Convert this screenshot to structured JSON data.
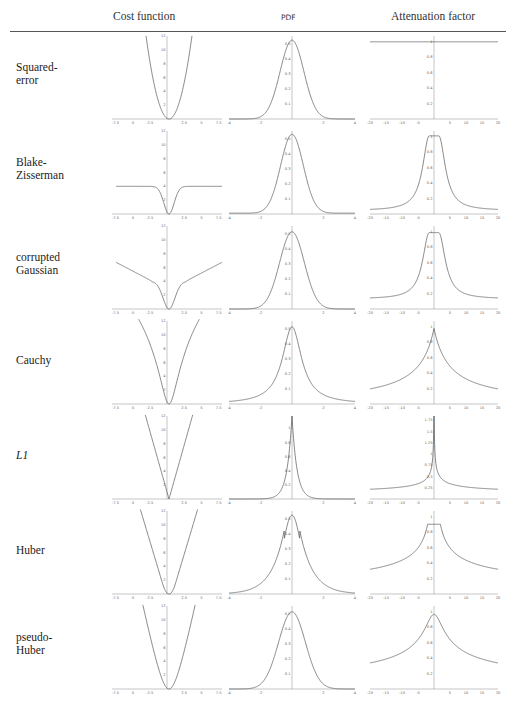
{
  "headers": {
    "cost": "Cost function",
    "pdf": "PDF",
    "attenuation": "Attenuation factor"
  },
  "rows": [
    {
      "label_line1": "Squared-",
      "label_line2": "error"
    },
    {
      "label_line1": "Blake-",
      "label_line2": "Zisserman"
    },
    {
      "label_line1": "corrupted",
      "label_line2": "Gaussian"
    },
    {
      "label_line1": "Cauchy",
      "label_line2": ""
    },
    {
      "label_line1": "L1",
      "label_line2": ""
    },
    {
      "label_line1": "Huber",
      "label_line2": ""
    },
    {
      "label_line1": "pseudo-",
      "label_line2": "Huber"
    }
  ],
  "axes": {
    "cost_x_ticks": [
      "-7.5",
      "-5",
      "-2.5",
      "2.5",
      "5",
      "7.5"
    ],
    "cost_y_ticks": [
      "2",
      "4",
      "6",
      "8",
      "10",
      "12"
    ],
    "pdf_x_ticks": [
      "-4",
      "-2",
      "2",
      "4"
    ],
    "pdf_y_ticks": [
      "0.1",
      "0.2",
      "0.3",
      "0.4",
      "0.5"
    ],
    "att_x_ticks": [
      "-20",
      "-15",
      "-10",
      "-5",
      "5",
      "10",
      "15",
      "20"
    ],
    "att_y_ticks": [
      "0.2",
      "0.4",
      "0.6",
      "0.8",
      "1"
    ],
    "l1_att_y_ticks": [
      "0.25",
      "0.5",
      "0.75",
      "1",
      "1.25",
      "1.5",
      "1.75"
    ],
    "l1_pdf_y_ticks": [
      "0.2",
      "0.4",
      "0.6",
      "0.8",
      "1"
    ]
  },
  "chart_data": [
    {
      "type": "line",
      "title": "Squared-error cost",
      "x": [
        -7.5,
        -5,
        -2.5,
        0,
        2.5,
        5,
        7.5
      ],
      "values": [
        56,
        25,
        6.25,
        0,
        6.25,
        25,
        56
      ],
      "xlabel": "",
      "ylabel": "",
      "ylim": [
        0,
        12
      ]
    },
    {
      "type": "line",
      "title": "Squared-error PDF",
      "x": [
        -4,
        -2,
        -1,
        0,
        1,
        2,
        4
      ],
      "values": [
        0,
        0.05,
        0.24,
        0.4,
        0.24,
        0.05,
        0
      ],
      "ylim": [
        0,
        0.5
      ]
    },
    {
      "type": "line",
      "title": "Squared-error attenuation",
      "x": [
        -20,
        0,
        20
      ],
      "values": [
        1,
        1,
        1
      ],
      "ylim": [
        0,
        1
      ]
    },
    {
      "type": "line",
      "title": "Blake-Zisserman cost",
      "x": [
        -7.5,
        -2.5,
        -1,
        0,
        1,
        2.5,
        7.5
      ],
      "values": [
        4,
        4,
        1.5,
        0,
        1.5,
        4,
        4
      ],
      "ylim": [
        0,
        12
      ]
    },
    {
      "type": "line",
      "title": "Blake-Zisserman attenuation",
      "x": [
        -20,
        -10,
        -5,
        0,
        5,
        10,
        20
      ],
      "values": [
        0.1,
        0.2,
        0.4,
        1,
        0.4,
        0.2,
        0.1
      ],
      "ylim": [
        0,
        1
      ]
    },
    {
      "type": "line",
      "title": "corrupted Gaussian cost",
      "x": [
        -7.5,
        -2.5,
        0,
        2.5,
        7.5
      ],
      "values": [
        6.5,
        4,
        0,
        4,
        6.5
      ],
      "ylim": [
        0,
        12
      ]
    },
    {
      "type": "line",
      "title": "corrupted Gaussian attenuation",
      "x": [
        -20,
        -5,
        0,
        5,
        20
      ],
      "values": [
        0.22,
        0.4,
        1,
        0.4,
        0.22
      ],
      "ylim": [
        0,
        1
      ]
    },
    {
      "type": "line",
      "title": "Cauchy cost",
      "x": [
        -7.5,
        -2.5,
        0,
        2.5,
        7.5
      ],
      "values": [
        12,
        6,
        0,
        6,
        12
      ],
      "ylim": [
        0,
        12
      ]
    },
    {
      "type": "line",
      "title": "Cauchy attenuation",
      "x": [
        -20,
        -5,
        0,
        5,
        20
      ],
      "values": [
        0.25,
        0.55,
        1,
        0.55,
        0.25
      ],
      "ylim": [
        0,
        1
      ]
    },
    {
      "type": "line",
      "title": "L1 cost",
      "x": [
        -3.5,
        0,
        3.5
      ],
      "values": [
        12,
        0,
        12
      ],
      "ylim": [
        0,
        12
      ]
    },
    {
      "type": "line",
      "title": "L1 attenuation",
      "x": [
        -20,
        -5,
        -1,
        1,
        5,
        20
      ],
      "values": [
        0.4,
        0.75,
        1.75,
        1.75,
        0.75,
        0.4
      ],
      "ylim": [
        0,
        1.75
      ]
    },
    {
      "type": "line",
      "title": "Huber cost",
      "x": [
        -4,
        -1,
        0,
        1,
        4
      ],
      "values": [
        12,
        1,
        0,
        1,
        12
      ],
      "ylim": [
        0,
        12
      ]
    },
    {
      "type": "line",
      "title": "Huber attenuation",
      "x": [
        -20,
        -2,
        0,
        2,
        20
      ],
      "values": [
        0.4,
        1,
        1,
        1,
        0.4
      ],
      "ylim": [
        0,
        1
      ]
    },
    {
      "type": "line",
      "title": "pseudo-Huber cost",
      "x": [
        -5,
        0,
        5
      ],
      "values": [
        12,
        0,
        12
      ],
      "ylim": [
        0,
        12
      ]
    },
    {
      "type": "line",
      "title": "pseudo-Huber attenuation",
      "x": [
        -20,
        0,
        20
      ],
      "values": [
        0.4,
        1,
        0.4
      ],
      "ylim": [
        0,
        1
      ]
    }
  ]
}
